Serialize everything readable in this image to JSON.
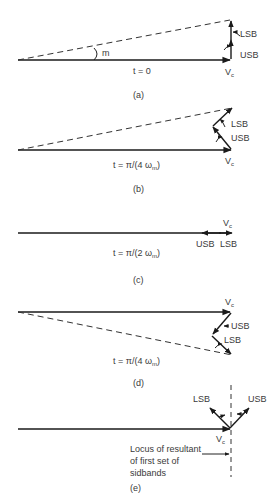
{
  "panels": [
    {
      "id": "a",
      "caption": "(a)",
      "time_label": "t = 0",
      "carrier_label": "V",
      "carrier_sub": "c",
      "angle_label": "m",
      "sideband_labels": {
        "lsb": "LSB",
        "usb": "USB"
      }
    },
    {
      "id": "b",
      "caption": "(b)",
      "time_label_prefix": "t = π/(4 ω",
      "time_label_sub": "m",
      "time_label_suffix": ")",
      "carrier_label": "V",
      "carrier_sub": "c",
      "sideband_labels": {
        "lsb": "LSB",
        "usb": "USB"
      }
    },
    {
      "id": "c",
      "caption": "(c)",
      "time_label_prefix": "t = π/(2 ω",
      "time_label_sub": "m",
      "time_label_suffix": ")",
      "carrier_label": "V",
      "carrier_sub": "c",
      "sideband_labels": {
        "lsb": "LSB",
        "usb": "USB"
      }
    },
    {
      "id": "d",
      "caption": "(d)",
      "time_label_prefix": "t = π/(4 ω",
      "time_label_sub": "m",
      "time_label_suffix": ")",
      "carrier_label": "V",
      "carrier_sub": "c",
      "sideband_labels": {
        "lsb": "LSB",
        "usb": "USB"
      }
    },
    {
      "id": "e",
      "caption": "(e)",
      "carrier_label": "V",
      "carrier_sub": "c",
      "sideband_labels": {
        "lsb": "LSB",
        "usb": "USB"
      },
      "locus_text": [
        "Locus of resultant",
        "of first set of",
        "sidbands"
      ]
    }
  ]
}
